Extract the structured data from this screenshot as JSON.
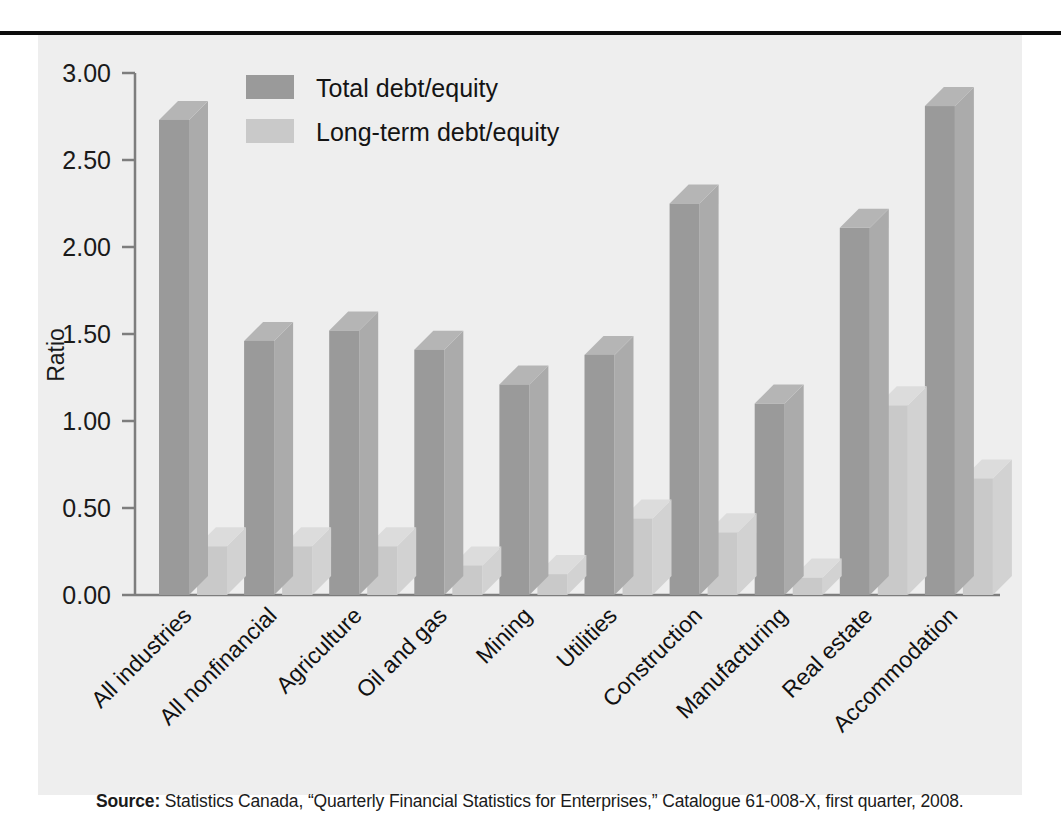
{
  "figure": {
    "source_prefix": "Source:",
    "source_text": " Statistics Canada, “Quarterly Financial Statistics for Enterprises,” Catalogue 61-008-X, first quarter, 2008.",
    "panel_background": "#eeeeee",
    "rule_color": "#0d0d0d"
  },
  "chart_data": {
    "type": "bar",
    "title": "",
    "subtitle": "",
    "xlabel": "",
    "ylabel": "Ratio",
    "ylim": [
      0,
      3.0
    ],
    "ytick_step": 0.5,
    "ytick_labels": [
      "0.00",
      "0.50",
      "1.00",
      "1.50",
      "2.00",
      "2.50",
      "3.00"
    ],
    "ytick_values": [
      0,
      0.5,
      1.0,
      1.5,
      2.0,
      2.5,
      3.0
    ],
    "grid": false,
    "legend_position": "top-center",
    "three_d": true,
    "categories": [
      "All industries",
      "All nonfinancial",
      "Agriculture",
      "Oil and gas",
      "Mining",
      "Utilities",
      "Construction",
      "Manufacturing",
      "Real estate",
      "Accommodation"
    ],
    "series": [
      {
        "name": "Total debt/equity",
        "color": "#9a9a9a",
        "top_color": "#b5b5b5",
        "side_color": "#ababab",
        "values": [
          2.73,
          1.46,
          1.52,
          1.41,
          1.21,
          1.38,
          2.25,
          1.1,
          2.11,
          2.81
        ]
      },
      {
        "name": "Long-term debt/equity",
        "color": "#c9c9c9",
        "top_color": "#dcdcdc",
        "side_color": "#d2d2d2",
        "values": [
          0.28,
          0.28,
          0.28,
          0.17,
          0.12,
          0.44,
          0.36,
          0.1,
          1.09,
          0.67
        ]
      }
    ]
  }
}
